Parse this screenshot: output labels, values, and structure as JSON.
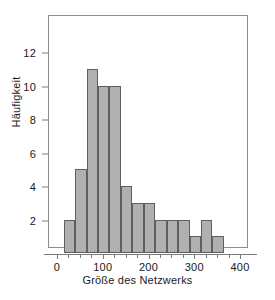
{
  "chart_data": {
    "type": "bar",
    "title": "",
    "subtitle": "",
    "xlabel": "Größe des Netzwerks",
    "ylabel": "Häufigkeit",
    "xlim": [
      0,
      412
    ],
    "ylim": [
      0,
      13
    ],
    "grid": false,
    "legend": null,
    "bin_width": 25,
    "categories": [
      "12.5-37.5",
      "37.5-62.5",
      "62.5-87.5",
      "87.5-112.5",
      "112.5-137.5",
      "137.5-162.5",
      "162.5-187.5",
      "187.5-212.5",
      "212.5-237.5",
      "237.5-262.5",
      "262.5-287.5",
      "287.5-312.5",
      "312.5-337.5",
      "337.5-362.5"
    ],
    "bins": [
      {
        "x0": 12.5,
        "x1": 37.5,
        "value": 2
      },
      {
        "x0": 37.5,
        "x1": 62.5,
        "value": 5
      },
      {
        "x0": 62.5,
        "x1": 87.5,
        "value": 11
      },
      {
        "x0": 87.5,
        "x1": 112.5,
        "value": 10
      },
      {
        "x0": 112.5,
        "x1": 137.5,
        "value": 10
      },
      {
        "x0": 137.5,
        "x1": 162.5,
        "value": 4
      },
      {
        "x0": 162.5,
        "x1": 187.5,
        "value": 3
      },
      {
        "x0": 187.5,
        "x1": 212.5,
        "value": 3
      },
      {
        "x0": 212.5,
        "x1": 237.5,
        "value": 2
      },
      {
        "x0": 237.5,
        "x1": 262.5,
        "value": 2
      },
      {
        "x0": 262.5,
        "x1": 287.5,
        "value": 2
      },
      {
        "x0": 287.5,
        "x1": 312.5,
        "value": 1
      },
      {
        "x0": 312.5,
        "x1": 337.5,
        "value": 2
      },
      {
        "x0": 337.5,
        "x1": 362.5,
        "value": 1
      }
    ],
    "values": [
      2,
      5,
      11,
      10,
      10,
      4,
      3,
      3,
      2,
      2,
      2,
      1,
      2,
      1
    ],
    "xticks": [
      {
        "value": 0,
        "label": "0"
      },
      {
        "value": 100,
        "label": "100"
      },
      {
        "value": 200,
        "label": "200"
      },
      {
        "value": 300,
        "label": "300"
      },
      {
        "value": 400,
        "label": "400"
      }
    ],
    "xminorticks": [
      25,
      50,
      75,
      125,
      150,
      175,
      225,
      250,
      275,
      325,
      350,
      375
    ],
    "yticks": [
      {
        "value": 2,
        "label": "2"
      },
      {
        "value": 4,
        "label": "4"
      },
      {
        "value": 6,
        "label": "6"
      },
      {
        "value": 8,
        "label": "8"
      },
      {
        "value": 10,
        "label": "10"
      },
      {
        "value": 12,
        "label": "12"
      }
    ],
    "colors": {
      "bar_fill": "#b0b0b0",
      "bar_edge": "#5f5f5f",
      "frame": "#8d8d8d",
      "axis": "#7a7a7a",
      "text": "#1a1a1a",
      "background": "#ffffff"
    }
  }
}
